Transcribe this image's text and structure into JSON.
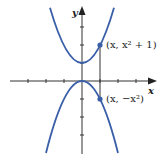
{
  "figure": {
    "type": "graph-diagram",
    "axes": {
      "x_label": "x",
      "y_label": "y",
      "unit_px": 18,
      "origin_px": [
        82,
        81
      ],
      "x_ticks": [
        -3,
        -2,
        -1,
        1,
        2,
        3
      ],
      "y_ticks": [
        3,
        2,
        1,
        -1,
        -2,
        -3
      ]
    },
    "curves": [
      {
        "name": "upper-parabola",
        "equation": "y = x^2 + 1",
        "color": "#3a5fa8"
      },
      {
        "name": "lower-parabola",
        "equation": "y = -x^2",
        "color": "#3a5fa8"
      }
    ],
    "points": [
      {
        "name": "upper-point",
        "x": 1,
        "y": 2,
        "label": "(x, x² + 1)"
      },
      {
        "name": "lower-point",
        "x": 1,
        "y": -1,
        "label": "(x, −x²)"
      }
    ],
    "connector": {
      "from_y": 2,
      "to_y": -1,
      "at_x": 1
    },
    "colors": {
      "curve": "#3a5fa8",
      "axis": "#333333",
      "point": "#3a5fa8"
    }
  }
}
